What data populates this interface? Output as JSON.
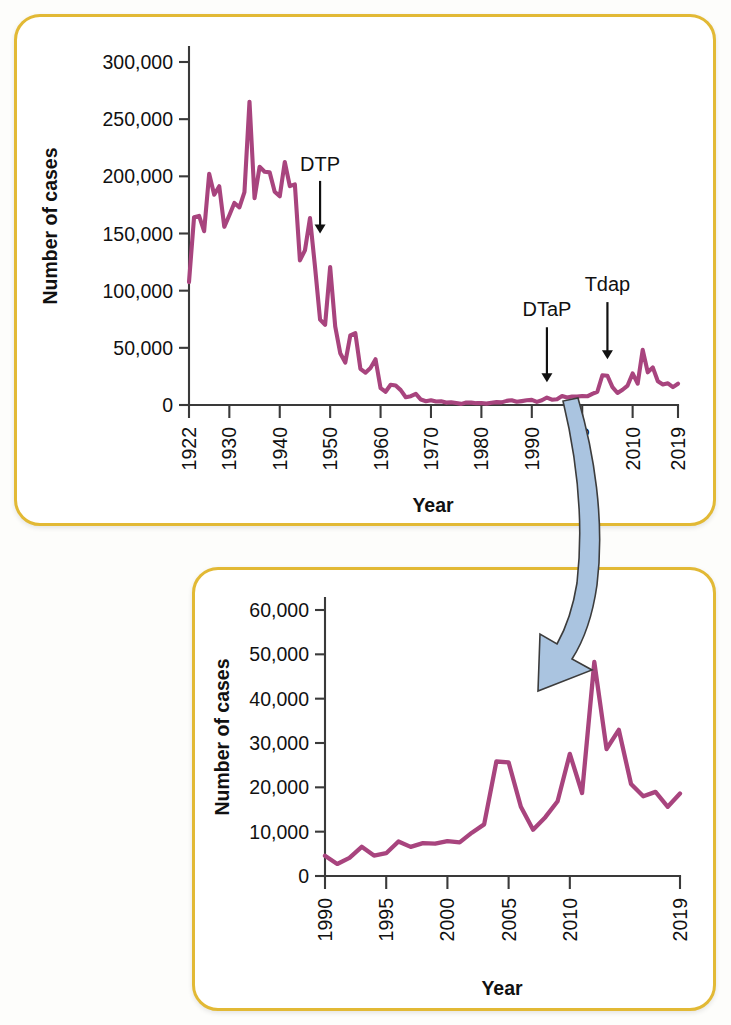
{
  "figure": {
    "line_color": "#a8447e",
    "frame_color": "#e2b935",
    "arrow_color": "#aac4e0"
  },
  "chart_data": [
    {
      "id": "top",
      "type": "line",
      "title": "",
      "xlabel": "Year",
      "ylabel": "Number of cases",
      "xlim": [
        1922,
        2019
      ],
      "ylim": [
        0,
        300000
      ],
      "grid": false,
      "legend": "none",
      "xticks": [
        "1922",
        "1930",
        "1940",
        "1950",
        "1960",
        "1970",
        "1980",
        "1990",
        "2000",
        "2010",
        "2019"
      ],
      "xtick_values": [
        1922,
        1930,
        1940,
        1950,
        1960,
        1970,
        1980,
        1990,
        2000,
        2010,
        2019
      ],
      "yticks": [
        "0",
        "50,000",
        "100,000",
        "150,000",
        "200,000",
        "250,000",
        "300,000"
      ],
      "ytick_values": [
        0,
        50000,
        100000,
        150000,
        200000,
        250000,
        300000
      ],
      "annotations": [
        {
          "label": "DTP",
          "year": 1948,
          "label_y": 205000,
          "arrow_from": 196000,
          "arrow_to": 150000
        },
        {
          "label": "DTaP",
          "year": 1993,
          "label_y": 78000,
          "arrow_from": 68000,
          "arrow_to": 20000
        },
        {
          "label": "Tdap",
          "year": 2005,
          "label_y": 100000,
          "arrow_from": 90000,
          "arrow_to": 40000
        }
      ],
      "x": [
        1922,
        1923,
        1924,
        1925,
        1926,
        1927,
        1928,
        1929,
        1930,
        1931,
        1932,
        1933,
        1934,
        1935,
        1936,
        1937,
        1938,
        1939,
        1940,
        1941,
        1942,
        1943,
        1944,
        1945,
        1946,
        1947,
        1948,
        1949,
        1950,
        1951,
        1952,
        1953,
        1954,
        1955,
        1956,
        1957,
        1958,
        1959,
        1960,
        1961,
        1962,
        1963,
        1964,
        1965,
        1966,
        1967,
        1968,
        1969,
        1970,
        1971,
        1972,
        1973,
        1974,
        1975,
        1976,
        1977,
        1978,
        1979,
        1980,
        1981,
        1982,
        1983,
        1984,
        1985,
        1986,
        1987,
        1988,
        1989,
        1990,
        1991,
        1992,
        1993,
        1994,
        1995,
        1996,
        1997,
        1998,
        1999,
        2000,
        2001,
        2002,
        2003,
        2004,
        2005,
        2006,
        2007,
        2008,
        2009,
        2010,
        2011,
        2012,
        2013,
        2014,
        2015,
        2016,
        2017,
        2018,
        2019
      ],
      "values": [
        107473,
        164191,
        165418,
        152003,
        202210,
        183866,
        191383,
        155844,
        165963,
        176695,
        172891,
        186164,
        265269,
        180827,
        208300,
        204000,
        203475,
        186500,
        182500,
        212500,
        191400,
        193000,
        126500,
        135300,
        163500,
        120700,
        74700,
        70200,
        120700,
        68700,
        45300,
        37100,
        60900,
        62800,
        31700,
        28300,
        32400,
        40000,
        14800,
        11600,
        17700,
        17000,
        13000,
        6800,
        7700,
        9700,
        4800,
        3300,
        4200,
        3000,
        3300,
        2100,
        2400,
        1700,
        1000,
        2200,
        2100,
        1600,
        1700,
        1200,
        2000,
        2500,
        2300,
        3600,
        4200,
        2800,
        3400,
        4100,
        4500,
        2700,
        4100,
        6500,
        4600,
        5100,
        7800,
        6500,
        7400,
        7300,
        7800,
        7600,
        9800,
        11600,
        26000,
        25600,
        15600,
        10500,
        13300,
        17000,
        27600,
        18700,
        48200,
        28600,
        32900,
        20800,
        18000,
        19000,
        15600,
        18600
      ]
    },
    {
      "id": "bottom",
      "type": "line",
      "title": "",
      "xlabel": "Year",
      "ylabel": "Number of cases",
      "xlim": [
        1990,
        2019
      ],
      "ylim": [
        0,
        60000
      ],
      "grid": false,
      "legend": "none",
      "xticks": [
        "1990",
        "1995",
        "2000",
        "2005",
        "2010",
        "2019"
      ],
      "xtick_values": [
        1990,
        1995,
        2000,
        2005,
        2010,
        2019
      ],
      "yticks": [
        "0",
        "10,000",
        "20,000",
        "30,000",
        "40,000",
        "50,000",
        "60,000"
      ],
      "ytick_values": [
        0,
        10000,
        20000,
        30000,
        40000,
        50000,
        60000
      ],
      "x": [
        1990,
        1991,
        1992,
        1993,
        1994,
        1995,
        1996,
        1997,
        1998,
        1999,
        2000,
        2001,
        2002,
        2003,
        2004,
        2005,
        2006,
        2007,
        2008,
        2009,
        2010,
        2011,
        2012,
        2013,
        2014,
        2015,
        2016,
        2017,
        2018,
        2019
      ],
      "values": [
        4570,
        2719,
        4083,
        6586,
        4617,
        5137,
        7796,
        6564,
        7405,
        7298,
        7867,
        7580,
        9771,
        11647,
        25827,
        25616,
        15632,
        10454,
        13278,
        16858,
        27550,
        18719,
        48277,
        28639,
        32971,
        20762,
        17972,
        18975,
        15609,
        18617
      ]
    }
  ]
}
